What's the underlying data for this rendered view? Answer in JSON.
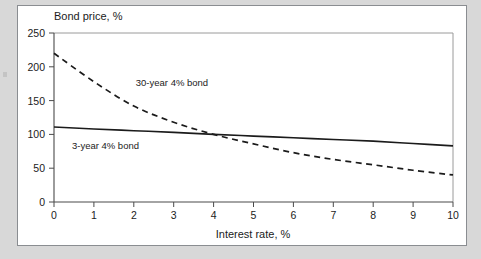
{
  "figure": {
    "background_color": "#d8d8d8",
    "panel_color": "#ffffff",
    "border_color": "#8a8d91"
  },
  "chart_data": {
    "type": "line",
    "title": "",
    "xlabel": "Interest rate, %",
    "ylabel": "Bond price, %",
    "xlim": [
      0,
      10
    ],
    "ylim": [
      0,
      250
    ],
    "xticks": [
      0,
      1,
      2,
      3,
      4,
      5,
      6,
      7,
      8,
      9,
      10
    ],
    "yticks": [
      0,
      50,
      100,
      150,
      200,
      250
    ],
    "xtick_labels": [
      "0",
      "1",
      "2",
      "3",
      "4",
      "5",
      "6",
      "7",
      "8",
      "9",
      "10"
    ],
    "ytick_labels": [
      "0",
      "50",
      "100",
      "150",
      "200",
      "250"
    ],
    "grid": false,
    "legend_position": "inline-annotation",
    "x": [
      0,
      1,
      2,
      3,
      4,
      5,
      6,
      7,
      8,
      9,
      10
    ],
    "series": [
      {
        "name": "30-year 4% bond",
        "style": "dashed",
        "color": "#1b1b1b",
        "values": [
          220,
          178,
          142,
          118,
          100,
          86,
          73,
          63,
          55,
          47,
          40
        ],
        "label_x": 2.05,
        "label_y": 172
      },
      {
        "name": "3-year 4% bond",
        "style": "solid",
        "color": "#1b1b1b",
        "values": [
          111,
          108,
          105.5,
          103,
          100,
          97.5,
          95,
          92.5,
          90,
          86.5,
          83
        ],
        "label_x": 0.45,
        "label_y": 78
      }
    ],
    "annotations": [
      {
        "text": "30-year 4% bond",
        "x": 2.05,
        "y": 172
      },
      {
        "text": "3-year 4% bond",
        "x": 0.45,
        "y": 78
      }
    ]
  }
}
